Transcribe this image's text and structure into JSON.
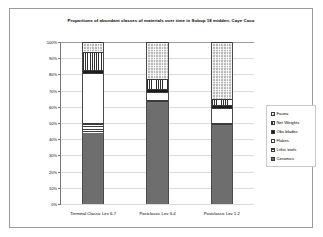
{
  "chart_data": {
    "type": "bar",
    "subtype": "stacked-100-percent",
    "title": "Proportions of abundant classes of materials over time in Subop 18 midden, Caye Coco",
    "xlabel": "",
    "ylabel": "",
    "ylim": [
      0,
      100
    ],
    "ytick_labels": [
      "100%",
      "90%",
      "80%",
      "70%",
      "60%",
      "50%",
      "40%",
      "30%",
      "20%",
      "10%",
      "0%"
    ],
    "ytick_values": [
      100,
      90,
      80,
      70,
      60,
      50,
      40,
      30,
      20,
      10,
      0
    ],
    "grid": true,
    "legend_position": "right",
    "categories": [
      "Terminal Classic Lev 6-7",
      "Postclassic Lev 3-4",
      "Postclassic Lev 1-2"
    ],
    "series": [
      {
        "name": "Ceramics",
        "pattern": "solid-dark-gray",
        "color": "#6e6e6e",
        "values": [
          44,
          63,
          49
        ]
      },
      {
        "name": "Lithic tools",
        "pattern": "horizontal-stripes",
        "color": "#3c3c3c",
        "values": [
          6,
          1,
          1
        ]
      },
      {
        "name": "Flakes",
        "pattern": "solid-white",
        "color": "#ffffff",
        "values": [
          31,
          5,
          9
        ]
      },
      {
        "name": "Obs blades",
        "pattern": "solid-black",
        "color": "#1c1c1c",
        "values": [
          2,
          2,
          2
        ]
      },
      {
        "name": "Net Weights",
        "pattern": "vertical-stripes",
        "color": "#2f2f2f",
        "values": [
          11,
          6,
          4
        ]
      },
      {
        "name": "Fauna",
        "pattern": "fine-checker",
        "color": "#b7b7b7",
        "values": [
          6,
          23,
          35
        ]
      }
    ],
    "legend_order": [
      "Fauna",
      "Net Weights",
      "Obs blades",
      "Flakes",
      "Lithic tools",
      "Ceramics"
    ]
  }
}
